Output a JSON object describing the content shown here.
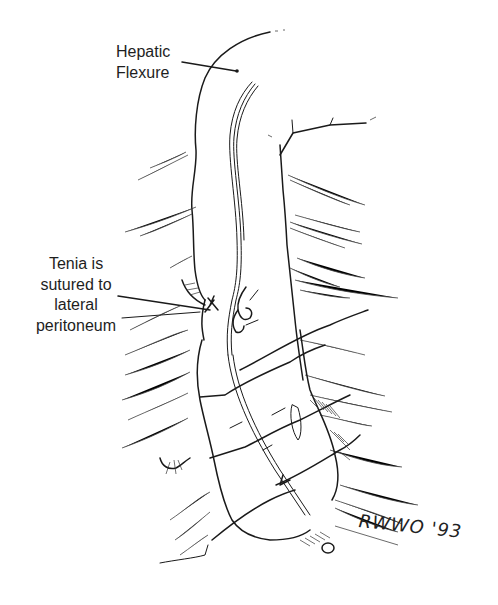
{
  "figure": {
    "labels": {
      "hepatic_flexure": {
        "line1": "Hepatic",
        "line2": "Flexure"
      },
      "tenia": {
        "line1": "Tenia is",
        "line2": "sutured to",
        "line3": "lateral",
        "line4": "peritoneum"
      }
    },
    "signature": "RWWO '93",
    "colors": {
      "ink": "#1a1a1a",
      "background": "#ffffff"
    }
  }
}
